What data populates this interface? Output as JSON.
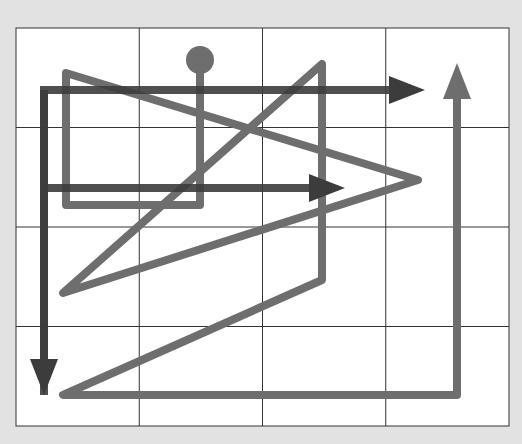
{
  "diagram": {
    "type": "path-tracing-puzzle",
    "background": "#e2e2e2",
    "grid": {
      "x": 16,
      "y": 28,
      "width": 493,
      "height": 398,
      "cols": 4,
      "rows": 4,
      "fill": "#ffffff",
      "line_color": "#333333"
    },
    "colors": {
      "light_path": "#6e6e6e",
      "dark_path": "#3c3c3c"
    },
    "light_path": {
      "start_circle": {
        "cx": 200,
        "cy": 60,
        "r": 14
      },
      "points": [
        [
          200,
          60
        ],
        [
          200,
          205
        ],
        [
          66,
          205
        ],
        [
          66,
          73
        ],
        [
          418,
          180
        ],
        [
          63,
          293
        ],
        [
          322,
          64
        ],
        [
          322,
          280
        ],
        [
          63,
          395
        ],
        [
          457,
          395
        ],
        [
          457,
          98
        ]
      ],
      "arrow": {
        "direction": "up",
        "tip": [
          457,
          63
        ]
      }
    },
    "dark_paths": [
      {
        "points": [
          [
            44,
            395
          ],
          [
            44,
            90
          ],
          [
            390,
            90
          ]
        ],
        "arrow": {
          "direction": "right",
          "tip": [
            425,
            90
          ]
        }
      },
      {
        "points": [
          [
            44,
            360
          ],
          [
            44,
            90
          ]
        ],
        "arrow": {
          "direction": "down",
          "tip": [
            44,
            395
          ]
        }
      },
      {
        "points": [
          [
            44,
            188
          ],
          [
            312,
            188
          ]
        ],
        "arrow": {
          "direction": "right",
          "tip": [
            345,
            188
          ]
        }
      }
    ]
  }
}
